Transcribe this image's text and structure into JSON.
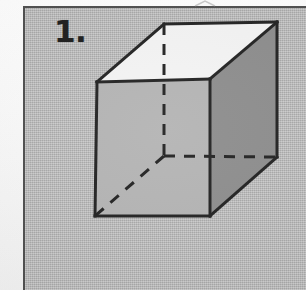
{
  "document": {
    "kind": "scanned-worksheet-figure",
    "item_number": "1.",
    "background_color": "#b9b9b9",
    "border_color": "#4e4e4e",
    "page_margin_color": "#fdfdfd"
  },
  "figure": {
    "name": "cube",
    "stroke_color": "#222222",
    "stroke_width": 3,
    "hidden_stroke_width": 3,
    "hidden_dash_pattern": "11 9",
    "faces": {
      "top_face_color": "#f4f4f4",
      "right_face_color": "#8d8d8d",
      "front_face_color": "#b4b4b4"
    },
    "vertices": {
      "front_top_left": [
        97,
        82
      ],
      "front_top_right": [
        210,
        79
      ],
      "front_bottom_right": [
        210,
        216
      ],
      "front_bottom_left": [
        95,
        216
      ],
      "back_top_left": [
        164,
        24
      ],
      "back_top_right": [
        277,
        22
      ],
      "back_bottom_right": [
        277,
        157
      ],
      "back_bottom_left_hidden": [
        164,
        156
      ]
    },
    "visible_edges": [
      "front_top_left -> front_top_right",
      "front_top_right -> front_bottom_right",
      "front_bottom_right -> front_bottom_left",
      "front_bottom_left -> front_top_left",
      "front_top_left -> back_top_left",
      "front_top_right -> back_top_right",
      "back_top_left -> back_top_right",
      "back_top_right -> back_bottom_right",
      "front_bottom_right -> back_bottom_right"
    ],
    "hidden_edges": [
      "back_top_left -> back_bottom_left_hidden",
      "back_bottom_left_hidden -> back_bottom_right",
      "back_bottom_left_hidden -> front_bottom_left"
    ]
  },
  "artifacts": {
    "top_chevron_mark": "^"
  }
}
